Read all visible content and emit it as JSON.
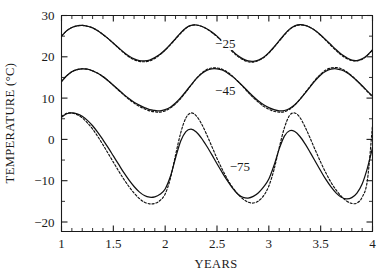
{
  "chart_data": {
    "type": "line",
    "title": "",
    "xlabel": "YEARS",
    "ylabel": "TEMPERATURE (°C)",
    "xlim": [
      1,
      4
    ],
    "ylim": [
      -22.3,
      30
    ],
    "grid": false,
    "legend_position": "inline-curve-labels",
    "x_ticks_major": [
      1,
      1.5,
      2,
      2.5,
      3,
      3.5,
      4
    ],
    "x_tick_labels": [
      "1",
      "1.5",
      "2",
      "2.5",
      "3",
      "3.5",
      "4"
    ],
    "x_tick_minor_step": 0.1,
    "y_ticks_major": [
      30,
      20,
      10,
      0,
      -10,
      -20
    ],
    "y_tick_labels": [
      "30",
      "20",
      "10",
      "0",
      "−10",
      "−20"
    ],
    "y_tick_minor_step": 5,
    "annotations": [
      {
        "text": "−25",
        "x": 2.58,
        "y": 23.2,
        "series": "depth-25"
      },
      {
        "text": "−45",
        "x": 2.58,
        "y": 11.8,
        "series": "depth-45"
      },
      {
        "text": "−75",
        "x": 2.72,
        "y": -6.6,
        "series": "depth-75"
      }
    ],
    "series": [
      {
        "name": "depth -25 cm (solid)",
        "label": "−25",
        "style": "solid",
        "x": [
          1.0,
          1.05,
          1.1,
          1.15,
          1.2,
          1.25,
          1.3,
          1.35,
          1.4,
          1.45,
          1.5,
          1.55,
          1.6,
          1.65,
          1.7,
          1.75,
          1.8,
          1.85,
          1.9,
          1.95,
          2.0,
          2.05,
          2.1,
          2.15,
          2.2,
          2.25,
          2.3,
          2.35,
          2.4,
          2.45,
          2.5,
          2.55,
          2.6,
          2.65,
          2.7,
          2.75,
          2.8,
          2.85,
          2.9,
          2.95,
          3.0,
          3.05,
          3.1,
          3.15,
          3.2,
          3.25,
          3.3,
          3.35,
          3.4,
          3.45,
          3.5,
          3.55,
          3.6,
          3.65,
          3.7,
          3.75,
          3.8,
          3.85,
          3.9,
          3.95,
          4.0
        ],
        "y": [
          25.0,
          26.3,
          27.1,
          27.5,
          27.6,
          27.4,
          27.0,
          26.3,
          25.4,
          24.4,
          23.3,
          22.2,
          21.1,
          20.2,
          19.5,
          19.1,
          19.0,
          19.2,
          19.8,
          20.6,
          21.7,
          23.0,
          24.4,
          25.8,
          27.0,
          27.6,
          27.7,
          27.4,
          26.8,
          26.0,
          25.0,
          23.8,
          22.6,
          21.4,
          20.3,
          19.5,
          19.0,
          18.9,
          19.2,
          19.9,
          21.0,
          22.4,
          23.9,
          25.4,
          26.7,
          27.5,
          27.8,
          27.6,
          27.1,
          26.3,
          25.3,
          24.1,
          22.9,
          21.7,
          20.6,
          19.8,
          19.2,
          19.1,
          19.5,
          20.4,
          21.7
        ]
      },
      {
        "name": "depth -25 cm (dotted)",
        "label": "−25",
        "style": "dotted",
        "x": [
          1.0,
          1.05,
          1.1,
          1.15,
          1.2,
          1.25,
          1.3,
          1.35,
          1.4,
          1.45,
          1.5,
          1.55,
          1.6,
          1.65,
          1.7,
          1.75,
          1.8,
          1.85,
          1.9,
          1.95,
          2.0,
          2.05,
          2.1,
          2.15,
          2.2,
          2.25,
          2.3,
          2.35,
          2.4,
          2.45,
          2.5,
          2.55,
          2.6,
          2.65,
          2.7,
          2.75,
          2.8,
          2.85,
          2.9,
          2.95,
          3.0,
          3.05,
          3.1,
          3.15,
          3.2,
          3.25,
          3.3,
          3.35,
          3.4,
          3.45,
          3.5,
          3.55,
          3.6,
          3.65,
          3.7,
          3.75,
          3.8,
          3.85,
          3.9,
          3.95,
          4.0
        ],
        "y": [
          25.0,
          26.3,
          27.1,
          27.5,
          27.6,
          27.4,
          27.0,
          26.3,
          25.4,
          24.4,
          23.3,
          22.1,
          21.0,
          20.0,
          19.3,
          18.9,
          18.8,
          19.0,
          19.6,
          20.5,
          21.6,
          22.9,
          24.3,
          25.7,
          26.9,
          27.6,
          27.7,
          27.4,
          26.8,
          25.9,
          24.9,
          23.7,
          22.4,
          21.2,
          20.1,
          19.3,
          18.8,
          18.7,
          19.1,
          19.8,
          20.9,
          22.3,
          23.8,
          25.3,
          26.6,
          27.4,
          27.7,
          27.6,
          27.1,
          26.3,
          25.2,
          24.0,
          22.7,
          21.5,
          20.4,
          19.6,
          19.1,
          19.0,
          19.4,
          20.3,
          21.6
        ]
      },
      {
        "name": "depth -45 cm (solid)",
        "label": "−45",
        "style": "solid",
        "x": [
          1.0,
          1.05,
          1.1,
          1.15,
          1.2,
          1.25,
          1.3,
          1.35,
          1.4,
          1.45,
          1.5,
          1.55,
          1.6,
          1.65,
          1.7,
          1.75,
          1.8,
          1.85,
          1.9,
          1.95,
          2.0,
          2.05,
          2.1,
          2.15,
          2.2,
          2.25,
          2.3,
          2.35,
          2.4,
          2.45,
          2.5,
          2.55,
          2.6,
          2.65,
          2.7,
          2.75,
          2.8,
          2.85,
          2.9,
          2.95,
          3.0,
          3.05,
          3.1,
          3.15,
          3.2,
          3.25,
          3.3,
          3.35,
          3.4,
          3.45,
          3.5,
          3.55,
          3.6,
          3.65,
          3.7,
          3.75,
          3.8,
          3.85,
          3.9,
          3.95,
          4.0
        ],
        "y": [
          14.0,
          15.4,
          16.4,
          16.9,
          17.1,
          17.0,
          16.6,
          16.0,
          15.2,
          14.2,
          13.1,
          12.0,
          10.9,
          9.9,
          9.0,
          8.3,
          7.7,
          7.2,
          7.0,
          6.9,
          7.2,
          7.8,
          8.8,
          10.1,
          11.6,
          13.2,
          14.7,
          15.9,
          16.7,
          17.1,
          17.1,
          16.8,
          16.1,
          15.2,
          14.1,
          12.9,
          11.6,
          10.4,
          9.3,
          8.4,
          7.7,
          7.2,
          6.9,
          7.0,
          7.5,
          8.4,
          9.7,
          11.2,
          12.8,
          14.3,
          15.6,
          16.5,
          17.0,
          17.1,
          16.8,
          16.2,
          15.3,
          14.2,
          13.0,
          11.7,
          10.5
        ]
      },
      {
        "name": "depth -45 cm (dotted)",
        "label": "−45",
        "style": "dotted",
        "x": [
          1.0,
          1.05,
          1.1,
          1.15,
          1.2,
          1.25,
          1.3,
          1.35,
          1.4,
          1.45,
          1.5,
          1.55,
          1.6,
          1.65,
          1.7,
          1.75,
          1.8,
          1.85,
          1.9,
          1.95,
          2.0,
          2.05,
          2.1,
          2.15,
          2.2,
          2.25,
          2.3,
          2.35,
          2.4,
          2.45,
          2.5,
          2.55,
          2.6,
          2.65,
          2.7,
          2.75,
          2.8,
          2.85,
          2.9,
          2.95,
          3.0,
          3.05,
          3.1,
          3.15,
          3.2,
          3.25,
          3.3,
          3.35,
          3.4,
          3.45,
          3.5,
          3.55,
          3.6,
          3.65,
          3.7,
          3.75,
          3.8,
          3.85,
          3.9,
          3.95,
          4.0
        ],
        "y": [
          14.0,
          15.4,
          16.4,
          16.9,
          17.1,
          17.0,
          16.6,
          16.0,
          15.2,
          14.2,
          13.1,
          11.9,
          10.8,
          9.7,
          8.8,
          8.0,
          7.4,
          6.9,
          6.7,
          6.6,
          6.9,
          7.6,
          8.6,
          9.9,
          11.5,
          13.1,
          14.7,
          16.0,
          16.9,
          17.3,
          17.3,
          17.0,
          16.3,
          15.3,
          14.1,
          12.8,
          11.4,
          10.1,
          9.0,
          8.0,
          7.3,
          6.8,
          6.6,
          6.7,
          7.3,
          8.3,
          9.7,
          11.3,
          12.9,
          14.5,
          15.8,
          16.8,
          17.3,
          17.4,
          17.1,
          16.4,
          15.4,
          14.2,
          12.9,
          11.6,
          10.3
        ]
      },
      {
        "name": "depth -75 cm (solid)",
        "label": "−75",
        "style": "solid",
        "x": [
          1.0,
          1.05,
          1.1,
          1.15,
          1.2,
          1.25,
          1.3,
          1.35,
          1.4,
          1.45,
          1.5,
          1.55,
          1.6,
          1.65,
          1.7,
          1.75,
          1.8,
          1.85,
          1.9,
          1.95,
          2.0,
          2.05,
          2.1,
          2.15,
          2.2,
          2.25,
          2.3,
          2.35,
          2.4,
          2.45,
          2.5,
          2.55,
          2.6,
          2.65,
          2.7,
          2.75,
          2.8,
          2.85,
          2.9,
          2.95,
          3.0,
          3.05,
          3.1,
          3.15,
          3.2,
          3.25,
          3.3,
          3.35,
          3.4,
          3.45,
          3.5,
          3.55,
          3.6,
          3.65,
          3.7,
          3.75,
          3.8,
          3.85,
          3.9,
          3.95,
          4.0
        ],
        "y": [
          5.4,
          6.2,
          6.4,
          6.2,
          5.6,
          4.6,
          3.3,
          1.7,
          -0.1,
          -2.0,
          -4.0,
          -6.0,
          -8.0,
          -9.8,
          -11.4,
          -12.7,
          -13.6,
          -14.0,
          -13.9,
          -13.3,
          -12.0,
          -9.0,
          -4.5,
          -0.4,
          1.9,
          2.5,
          1.8,
          0.3,
          -1.6,
          -3.7,
          -5.9,
          -8.0,
          -10.0,
          -11.8,
          -13.2,
          -14.0,
          -14.2,
          -13.8,
          -12.9,
          -11.5,
          -9.6,
          -6.3,
          -2.3,
          0.8,
          2.1,
          1.9,
          0.7,
          -1.1,
          -3.2,
          -5.4,
          -7.6,
          -9.7,
          -11.5,
          -13.0,
          -14.0,
          -14.4,
          -14.1,
          -13.0,
          -10.8,
          -7.0,
          -2.0
        ]
      },
      {
        "name": "depth -75 cm (dotted)",
        "label": "−75",
        "style": "dotted",
        "x": [
          1.0,
          1.05,
          1.1,
          1.15,
          1.2,
          1.25,
          1.3,
          1.35,
          1.4,
          1.45,
          1.5,
          1.55,
          1.6,
          1.65,
          1.7,
          1.75,
          1.8,
          1.85,
          1.9,
          1.95,
          2.0,
          2.05,
          2.1,
          2.15,
          2.2,
          2.25,
          2.3,
          2.35,
          2.4,
          2.45,
          2.5,
          2.55,
          2.6,
          2.65,
          2.7,
          2.75,
          2.8,
          2.85,
          2.9,
          2.95,
          3.0,
          3.05,
          3.1,
          3.15,
          3.2,
          3.25,
          3.3,
          3.35,
          3.4,
          3.45,
          3.5,
          3.55,
          3.6,
          3.65,
          3.7,
          3.75,
          3.8,
          3.85,
          3.9,
          3.95,
          4.0
        ],
        "y": [
          5.6,
          6.3,
          6.4,
          6.0,
          5.2,
          4.0,
          2.5,
          0.7,
          -1.3,
          -3.4,
          -5.5,
          -7.6,
          -9.6,
          -11.4,
          -13.0,
          -14.3,
          -15.2,
          -15.6,
          -15.5,
          -14.8,
          -13.2,
          -9.5,
          -3.8,
          1.6,
          5.2,
          6.4,
          5.7,
          3.8,
          1.2,
          -1.7,
          -4.6,
          -7.2,
          -9.6,
          -11.6,
          -13.2,
          -14.4,
          -15.2,
          -15.4,
          -14.9,
          -13.6,
          -11.3,
          -7.3,
          -2.0,
          2.8,
          5.8,
          6.4,
          5.3,
          3.0,
          0.2,
          -2.7,
          -5.5,
          -8.1,
          -10.4,
          -12.3,
          -13.8,
          -14.9,
          -15.5,
          -15.4,
          -14.0,
          -10.0,
          3.4
        ]
      }
    ]
  }
}
